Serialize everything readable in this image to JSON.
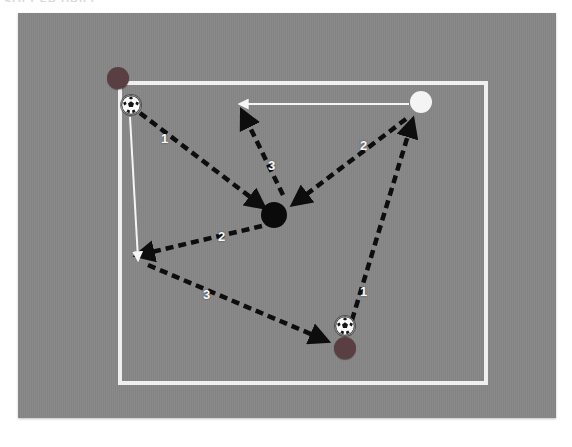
{
  "page": {
    "clipped_header_text": "SOCCER DRILL",
    "background_color": "#ffffff"
  },
  "diagram": {
    "field_color": "#868686",
    "boundary_color": "#f2f2f2",
    "pass_arrow_color": "#0d0d0d",
    "run_arrow_color": "#f5f5f5"
  },
  "players": [
    {
      "id": "p1",
      "name": "top-left-player",
      "color": "#5a3f42",
      "color_name": "dark-maroon",
      "x": 118,
      "y": 78,
      "r": 11,
      "has_ball": true
    },
    {
      "id": "p2",
      "name": "top-right-player",
      "color": "#f4f4f4",
      "color_name": "white",
      "x": 421,
      "y": 102,
      "r": 11,
      "has_ball": false
    },
    {
      "id": "p3",
      "name": "center-player",
      "color": "#0a0a0a",
      "color_name": "black",
      "x": 274,
      "y": 215,
      "r": 13,
      "has_ball": false
    },
    {
      "id": "p4",
      "name": "bottom-right-player",
      "color": "#5a3f42",
      "color_name": "dark-maroon",
      "x": 345,
      "y": 348,
      "r": 11,
      "has_ball": true
    }
  ],
  "balls": [
    {
      "id": "b1",
      "name": "ball-top-left",
      "x": 131,
      "y": 105
    },
    {
      "id": "b2",
      "name": "ball-bottom-right",
      "x": 345,
      "y": 326
    }
  ],
  "pass_arrows": [
    {
      "id": "a1",
      "name": "pass-1-topleft-to-center",
      "label": "1",
      "style": "dashed",
      "x1": 140,
      "y1": 113,
      "x2": 262,
      "y2": 206,
      "label_x": 161,
      "label_y": 132
    },
    {
      "id": "a2",
      "name": "pass-3-center-to-upper-left-space",
      "label": "3",
      "style": "dashed",
      "x1": 283,
      "y1": 195,
      "x2": 243,
      "y2": 113,
      "label_x": 268,
      "label_y": 159
    },
    {
      "id": "a3",
      "name": "pass-2-topright-to-center",
      "label": "2",
      "style": "dashed",
      "x1": 406,
      "y1": 119,
      "x2": 295,
      "y2": 203,
      "label_x": 360,
      "label_y": 139
    },
    {
      "id": "a4",
      "name": "pass-2-center-to-left-space",
      "label": "2",
      "style": "dashed",
      "x1": 262,
      "y1": 226,
      "x2": 139,
      "y2": 255,
      "label_x": 218,
      "label_y": 230
    },
    {
      "id": "a5",
      "name": "pass-3-left-space-to-bottomright",
      "label": "3",
      "style": "dashed",
      "x1": 148,
      "y1": 265,
      "x2": 325,
      "y2": 340,
      "label_x": 203,
      "label_y": 288
    },
    {
      "id": "a6",
      "name": "pass-1-bottomright-to-topright",
      "label": "1",
      "style": "dashed",
      "x1": 352,
      "y1": 320,
      "x2": 412,
      "y2": 122,
      "label_x": 360,
      "label_y": 285
    }
  ],
  "run_arrows": [
    {
      "id": "r1",
      "name": "run-topright-to-left",
      "style": "solid",
      "x1": 409,
      "y1": 104,
      "x2": 241,
      "y2": 104
    },
    {
      "id": "r2",
      "name": "run-topleft-downward",
      "style": "solid",
      "x1": 130,
      "y1": 117,
      "x2": 138,
      "y2": 259
    }
  ],
  "legend": {
    "sequence_numbers": [
      "1",
      "2",
      "3"
    ],
    "dashed_meaning": "pass",
    "solid_meaning": "player run"
  }
}
